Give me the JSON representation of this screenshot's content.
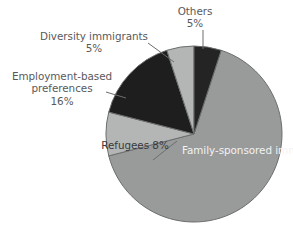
{
  "chart_data": {
    "type": "pie",
    "title": "",
    "subtitle": "",
    "xlabel": "",
    "ylabel": "",
    "legend_position": "none",
    "grid": false,
    "unit": "%",
    "total": 100,
    "start_angle_deg": 0,
    "direction": "clockwise",
    "categories": [
      "Others",
      "Family-sponsored immigrants",
      "Refugees",
      "Employment-based preferences",
      "Diversity immigrants"
    ],
    "values": [
      5,
      66,
      8,
      16,
      5
    ],
    "slices": [
      {
        "id": "others",
        "label": "Others",
        "value": 5,
        "value_text": "5%",
        "color": "#242425",
        "label_placement": "outside",
        "label_text_color": "#59595b",
        "leader_line": true
      },
      {
        "id": "family-sponsored",
        "label": "Family-sponsored immigrants",
        "label_line1": "Family-sponsored",
        "label_line2": "immigrants",
        "value": 66,
        "value_text": "66%",
        "color": "#999a9a",
        "label_placement": "inside",
        "label_text_color": "#f2f2f2",
        "leader_line": false
      },
      {
        "id": "refugees",
        "label": "Refugees",
        "value": 8,
        "value_text": "8%",
        "color": "#b4b5b5",
        "label_placement": "inside",
        "label_text_color": "#3a3a3c",
        "leader_line": false
      },
      {
        "id": "employment-based",
        "label": "Employment-based preferences",
        "label_line1": "Employment-based",
        "label_line2": "preferences",
        "value": 16,
        "value_text": "16%",
        "color": "#1e1e1f",
        "label_placement": "outside",
        "label_text_color": "#59595b",
        "leader_line": true
      },
      {
        "id": "diversity",
        "label": "Diversity immigrants",
        "value": 5,
        "value_text": "5%",
        "color": "#b4b5b5",
        "label_placement": "outside",
        "label_text_color": "#59595b",
        "leader_line": true
      }
    ]
  },
  "canvas": {
    "background": "#ffffff",
    "center_x": 194,
    "center_y": 134,
    "radius": 88,
    "outline_color": "#6c6d6e"
  }
}
